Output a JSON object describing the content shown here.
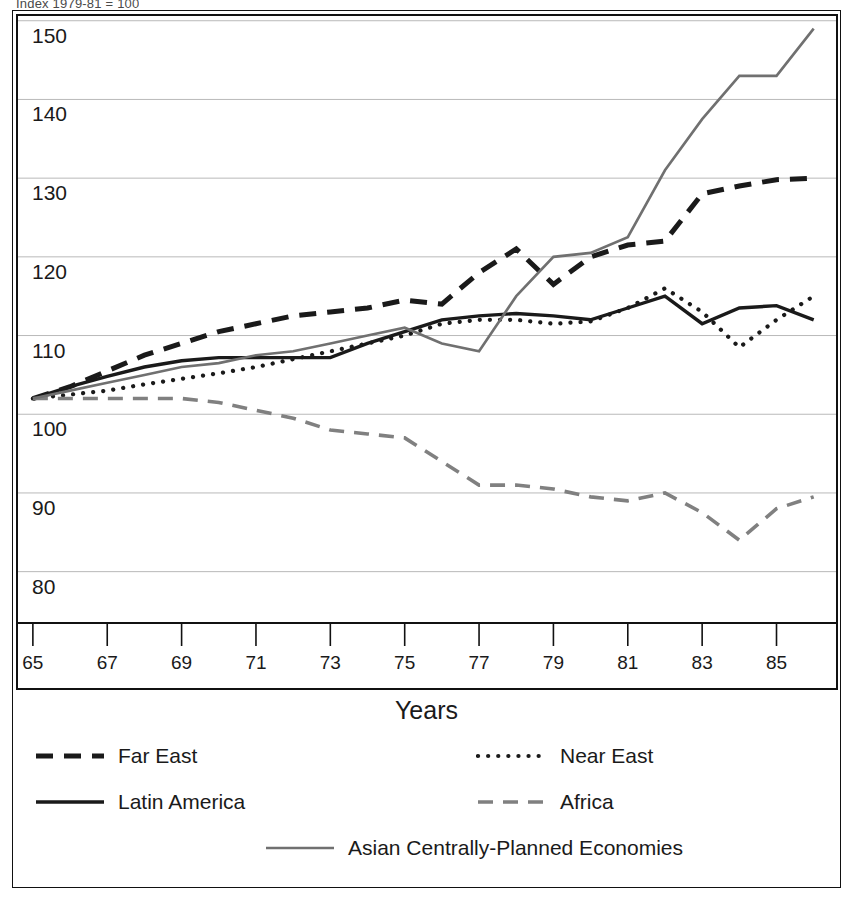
{
  "top_caption": "Index 1979-81 = 100",
  "axis_title": "Years",
  "y_axis": {
    "ticks": [
      "150",
      "140",
      "130",
      "120",
      "110",
      "100",
      "90",
      "80"
    ],
    "min": 75,
    "max": 152
  },
  "x_axis": {
    "ticks": [
      "65",
      "67",
      "69",
      "71",
      "73",
      "75",
      "77",
      "79",
      "81",
      "83",
      "85"
    ],
    "min": 1964.6,
    "max": 1986.6
  },
  "legend": {
    "items": [
      {
        "label": "Far East",
        "style": "dashed-thick",
        "color": "#1a1a1a"
      },
      {
        "label": "Near East",
        "style": "dotted",
        "color": "#1a1a1a"
      },
      {
        "label": "Latin America",
        "style": "solid",
        "color": "#1a1a1a"
      },
      {
        "label": "Africa",
        "style": "dashed",
        "color": "#808080"
      },
      {
        "label": "Asian Centrally-Planned Economies",
        "style": "solid-gray",
        "color": "#707070"
      }
    ]
  },
  "chart_data": {
    "type": "line",
    "title": "Index 1979-81 = 100",
    "xlabel": "Years",
    "ylabel": "",
    "xlim": [
      1964.6,
      1986.6
    ],
    "ylim": [
      75,
      152
    ],
    "grid": true,
    "legend_position": "bottom",
    "x": [
      1965,
      1966,
      1967,
      1968,
      1969,
      1970,
      1971,
      1972,
      1973,
      1974,
      1975,
      1976,
      1977,
      1978,
      1979,
      1980,
      1981,
      1982,
      1983,
      1984,
      1985,
      1986
    ],
    "series": [
      {
        "name": "Far East",
        "style": "dashed-thick",
        "color": "#1a1a1a",
        "values": [
          102,
          103.5,
          105.5,
          107.5,
          109,
          110.5,
          111.5,
          112.5,
          113,
          113.5,
          114.5,
          114,
          118,
          121,
          116.5,
          120,
          121.5,
          122,
          128,
          129,
          129.8,
          130
        ]
      },
      {
        "name": "Near East",
        "style": "dotted",
        "color": "#1a1a1a",
        "values": [
          102,
          102.5,
          103,
          103.8,
          104.5,
          105.2,
          106,
          107,
          108,
          109,
          110,
          111.5,
          112,
          112,
          111.5,
          111.8,
          113.5,
          116,
          113,
          108.5,
          112,
          115
        ]
      },
      {
        "name": "Latin America",
        "style": "solid",
        "color": "#1a1a1a",
        "values": [
          102,
          103.5,
          104.8,
          106,
          106.8,
          107.2,
          107.2,
          107.2,
          107.2,
          109,
          110.5,
          112,
          112.5,
          112.8,
          112.5,
          112,
          113.5,
          115,
          111.5,
          113.5,
          113.8,
          112
        ]
      },
      {
        "name": "Africa",
        "style": "dashed",
        "color": "#808080",
        "values": [
          102,
          102,
          102,
          102,
          102,
          101.5,
          100.5,
          99.5,
          98,
          97.5,
          97,
          94,
          91,
          91,
          90.5,
          89.5,
          89,
          90,
          87.5,
          84,
          88,
          89.5
        ]
      },
      {
        "name": "Asian Centrally-Planned Economies",
        "style": "solid-gray",
        "color": "#707070",
        "values": [
          102,
          103,
          104,
          105,
          106,
          106.5,
          107.5,
          108,
          109,
          110,
          111,
          109,
          108,
          115,
          120,
          120.5,
          122.5,
          131,
          137.5,
          143,
          143,
          149
        ]
      }
    ]
  }
}
